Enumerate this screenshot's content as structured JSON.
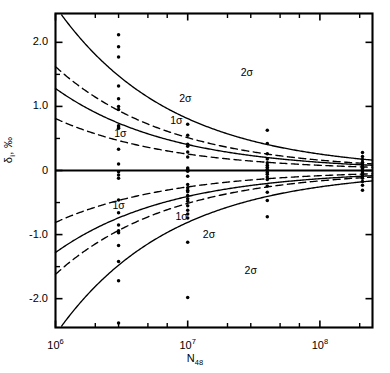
{
  "chart_data": {
    "type": "scatter",
    "title": "",
    "subtitle": "",
    "xlabel": "N48",
    "xlabel_base": "N",
    "xlabel_sub": "48",
    "ylabel": "δi, ‰",
    "ylabel_base": "δ",
    "ylabel_sub": "i",
    "ylabel_unit": ", ‰",
    "xscale": "log",
    "yscale": "linear",
    "xlim": [
      1000000,
      250000000
    ],
    "ylim": [
      -2.45,
      2.45
    ],
    "grid": false,
    "legend": "none",
    "xticks_major": [
      {
        "value": 1000000,
        "label_mantissa": "10",
        "label_exp": "6"
      },
      {
        "value": 10000000,
        "label_mantissa": "10",
        "label_exp": "7"
      },
      {
        "value": 100000000,
        "label_mantissa": "10",
        "label_exp": "8"
      }
    ],
    "xticks_minor": [
      2000000,
      3000000,
      5000000,
      7000000,
      20000000,
      30000000,
      50000000,
      70000000,
      200000000
    ],
    "yticks_major": [
      {
        "value": 2.0,
        "label": "2.0"
      },
      {
        "value": 1.0,
        "label": "1.0"
      },
      {
        "value": 0.0,
        "label": "0"
      },
      {
        "value": -1.0,
        "label": "-1.0"
      },
      {
        "value": -2.0,
        "label": "-2.0"
      }
    ],
    "yticks_minor": [
      1.5,
      0.5,
      -0.5,
      -1.5
    ],
    "zero_line": 0.0,
    "curves": [
      {
        "name": "+2sigma-solid",
        "style": "solid",
        "label": "2σ",
        "sign": 1,
        "amplitude": 2.56,
        "label_x": 28000000,
        "label_y": 1.47
      },
      {
        "name": "+2sigma-dashed",
        "style": "dashed",
        "label": "2σ",
        "sign": 1,
        "amplitude": 1.62,
        "label_x": 9600000,
        "label_y": 1.07
      },
      {
        "name": "+1sigma-solid",
        "style": "solid",
        "label": "1σ",
        "sign": 1,
        "amplitude": 1.28,
        "label_x": 8200000,
        "label_y": 0.72
      },
      {
        "name": "+1sigma-dashed",
        "style": "dashed",
        "label": "1σ",
        "sign": 1,
        "amplitude": 0.81,
        "label_x": 3100000,
        "label_y": 0.52
      },
      {
        "name": "-1sigma-dashed",
        "style": "dashed",
        "label": "1σ",
        "sign": -1,
        "amplitude": 0.81,
        "label_x": 3000000,
        "label_y": -0.6
      },
      {
        "name": "-1sigma-solid",
        "style": "solid",
        "label": "1σ",
        "sign": -1,
        "amplitude": 1.28,
        "label_x": 9000000,
        "label_y": -0.78
      },
      {
        "name": "-2sigma-dashed",
        "style": "dashed",
        "label": "2σ",
        "sign": -1,
        "amplitude": 1.62,
        "label_x": 14500000,
        "label_y": -1.06
      },
      {
        "name": "-2sigma-solid",
        "style": "solid",
        "label": "2σ",
        "sign": -1,
        "amplitude": 2.56,
        "label_x": 30000000,
        "label_y": -1.62
      }
    ],
    "series": [
      {
        "name": "group-3e6",
        "x": 3000000,
        "values": [
          2.12,
          1.93,
          1.77,
          1.32,
          1.12,
          1.0,
          0.95,
          0.7,
          0.68,
          0.66,
          0.33,
          0.1,
          -0.02,
          -0.07,
          -0.12,
          -0.46,
          -0.66,
          -0.85,
          -0.94,
          -0.97,
          -1.17,
          -1.42,
          -1.72,
          -2.38
        ]
      },
      {
        "name": "group-1e7",
        "x": 10000000,
        "values": [
          0.72,
          0.55,
          0.41,
          0.38,
          0.29,
          0.21,
          0.04,
          0.02,
          -0.01,
          -0.09,
          -0.22,
          -0.27,
          -0.31,
          -0.33,
          -0.39,
          -0.44,
          -0.48,
          -0.55,
          -0.62,
          -0.68,
          -0.74,
          -1.12,
          -1.98
        ]
      },
      {
        "name": "group-4e7",
        "x": 40000000,
        "values": [
          0.63,
          0.42,
          0.26,
          0.18,
          0.12,
          0.08,
          0.05,
          0.02,
          0.0,
          -0.03,
          -0.06,
          -0.1,
          -0.14,
          -0.24,
          -0.34,
          -0.47,
          -0.72
        ]
      },
      {
        "name": "group-2e8",
        "x": 210000000,
        "values": [
          0.28,
          0.22,
          0.17,
          0.13,
          0.1,
          0.07,
          0.05,
          0.03,
          0.01,
          0.0,
          -0.02,
          -0.04,
          -0.06,
          -0.09,
          -0.12,
          -0.17,
          -0.23,
          -0.31
        ]
      }
    ]
  },
  "axes": {
    "frame_color": "#000000",
    "line_color": "#000000",
    "point_color": "#000000"
  }
}
